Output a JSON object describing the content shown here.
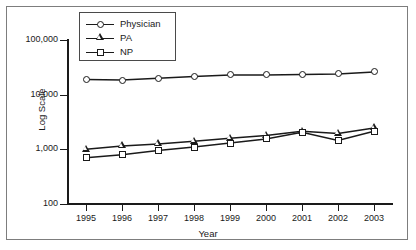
{
  "figure": {
    "title_faint": "",
    "background": "#ffffff",
    "border_color": "#7d7d7d",
    "ink_color": "#1a1a1a"
  },
  "axes": {
    "y_title": "Log Scale",
    "x_title": "Year",
    "y_ticks": [
      "100,000",
      "10,000",
      "1,000",
      "100"
    ],
    "y_tick_values": [
      100000,
      10000,
      1000,
      100
    ],
    "x_ticks": [
      "1995",
      "1996",
      "1997",
      "1998",
      "1999",
      "2000",
      "2001",
      "2002",
      "2003"
    ]
  },
  "legend": {
    "position": "top-left-inside",
    "entries": [
      {
        "label": "Physician",
        "marker": "circle-marker"
      },
      {
        "label": "PA",
        "marker": "triangle-marker"
      },
      {
        "label": "NP",
        "marker": "square-marker"
      }
    ]
  },
  "chart_data": {
    "type": "line",
    "title": "",
    "xlabel": "Year",
    "ylabel": "Log Scale",
    "yscale": "log",
    "ylim": [
      100,
      100000
    ],
    "grid": false,
    "legend_position": "upper left",
    "x": [
      1995,
      1996,
      1997,
      1998,
      1999,
      2000,
      2001,
      2002,
      2003
    ],
    "series": [
      {
        "name": "Physician",
        "marker": "circle",
        "values": [
          19000,
          18500,
          20000,
          21500,
          23000,
          23000,
          23500,
          24000,
          26000
        ]
      },
      {
        "name": "PA",
        "marker": "triangle",
        "values": [
          1000,
          1150,
          1250,
          1400,
          1600,
          1800,
          2150,
          1950,
          2450
        ]
      },
      {
        "name": "NP",
        "marker": "square",
        "values": [
          700,
          800,
          950,
          1100,
          1300,
          1550,
          2050,
          1450,
          2150
        ]
      }
    ]
  }
}
